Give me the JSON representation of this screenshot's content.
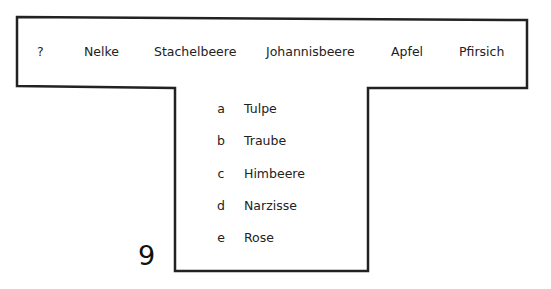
{
  "puzzle_number": "9",
  "sequence": [
    "?",
    "Nelke",
    "Stachelbeere",
    "Johannisbeere",
    "Apfel",
    "Pfirsich"
  ],
  "options": [
    {
      "letter": "a",
      "word": "Tulpe"
    },
    {
      "letter": "b",
      "word": "Traube"
    },
    {
      "letter": "c",
      "word": "Himbeere"
    },
    {
      "letter": "d",
      "word": "Narzisse"
    },
    {
      "letter": "e",
      "word": "Rose"
    }
  ],
  "colors": {
    "border": "#222222",
    "text": "#222222",
    "background": "#ffffff"
  }
}
